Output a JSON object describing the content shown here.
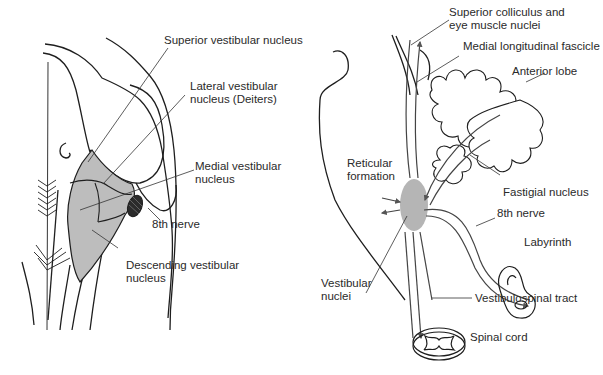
{
  "left_panel": {
    "labels": {
      "superior_vestibular_nucleus": [
        "Superior vestibular nucleus"
      ],
      "lateral_vestibular_nucleus": [
        "Lateral vestibular",
        "nucleus (Deiters)"
      ],
      "medial_vestibular_nucleus": [
        "Medial vestibular",
        "nucleus"
      ],
      "eighth_nerve": [
        "8th nerve"
      ],
      "descending_vestibular_nucleus": [
        "Descending vestibular",
        "nucleus"
      ]
    }
  },
  "right_panel": {
    "labels": {
      "superior_colliculus": [
        "Superior colliculus and",
        "eye muscle nuclei"
      ],
      "medial_longitudinal_fascicle": [
        "Medial longitudinal fascicle"
      ],
      "anterior_lobe": [
        "Anterior lobe"
      ],
      "reticular_formation": [
        "Reticular",
        "formation"
      ],
      "fastigial_nucleus": [
        "Fastigial nucleus"
      ],
      "eighth_nerve": [
        "8th nerve"
      ],
      "labyrinth": [
        "Labyrinth"
      ],
      "vestibular_nuclei": [
        "Vestibular",
        "nuclei"
      ],
      "vestibulospinal_tract": [
        "Vestibulospinal tract"
      ],
      "spinal_cord": [
        "Spinal cord"
      ]
    }
  },
  "colors": {
    "line": "#1e1e1e",
    "fill_gray": "#bdbdbd",
    "arrow_gray": "#6e6e6e",
    "nerve_dark": "#2b2b2b",
    "text": "#2a2a2a"
  }
}
